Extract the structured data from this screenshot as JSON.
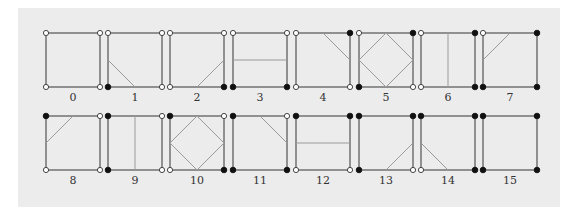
{
  "figure": {
    "colors": {
      "background": "#ececec",
      "edge": "#6a6a6a",
      "contour": "#9a9a9a",
      "vertex_filled": "#111111",
      "vertex_empty": "#ffffff"
    },
    "corner_bit_order": [
      "top-left",
      "top-right",
      "bottom-right",
      "bottom-left"
    ],
    "cases": [
      {
        "label": "0",
        "corners": [
          0,
          0,
          0,
          0
        ],
        "contour": []
      },
      {
        "label": "1",
        "corners": [
          0,
          0,
          0,
          1
        ],
        "contour": [
          [
            "L",
            "B"
          ]
        ]
      },
      {
        "label": "2",
        "corners": [
          0,
          0,
          1,
          0
        ],
        "contour": [
          [
            "B",
            "R"
          ]
        ]
      },
      {
        "label": "3",
        "corners": [
          0,
          0,
          1,
          1
        ],
        "contour": [
          [
            "L",
            "R"
          ]
        ]
      },
      {
        "label": "4",
        "corners": [
          0,
          1,
          0,
          0
        ],
        "contour": [
          [
            "T",
            "R"
          ]
        ]
      },
      {
        "label": "5",
        "corners": [
          0,
          1,
          0,
          1
        ],
        "contour": [
          [
            "L",
            "T"
          ],
          [
            "T",
            "R"
          ],
          [
            "R",
            "B"
          ],
          [
            "B",
            "L"
          ]
        ]
      },
      {
        "label": "6",
        "corners": [
          0,
          1,
          1,
          0
        ],
        "contour": [
          [
            "T",
            "B"
          ]
        ]
      },
      {
        "label": "7",
        "corners": [
          0,
          1,
          1,
          1
        ],
        "contour": [
          [
            "L",
            "T"
          ]
        ]
      },
      {
        "label": "8",
        "corners": [
          1,
          0,
          0,
          0
        ],
        "contour": [
          [
            "L",
            "T"
          ]
        ]
      },
      {
        "label": "9",
        "corners": [
          1,
          0,
          0,
          1
        ],
        "contour": [
          [
            "T",
            "B"
          ]
        ]
      },
      {
        "label": "10",
        "corners": [
          1,
          0,
          1,
          0
        ],
        "contour": [
          [
            "L",
            "T"
          ],
          [
            "T",
            "R"
          ],
          [
            "R",
            "B"
          ],
          [
            "B",
            "L"
          ]
        ]
      },
      {
        "label": "11",
        "corners": [
          1,
          0,
          1,
          1
        ],
        "contour": [
          [
            "T",
            "R"
          ]
        ]
      },
      {
        "label": "12",
        "corners": [
          1,
          1,
          0,
          0
        ],
        "contour": [
          [
            "L",
            "R"
          ]
        ]
      },
      {
        "label": "13",
        "corners": [
          1,
          1,
          0,
          1
        ],
        "contour": [
          [
            "B",
            "R"
          ]
        ]
      },
      {
        "label": "14",
        "corners": [
          1,
          1,
          1,
          0
        ],
        "contour": [
          [
            "L",
            "B"
          ]
        ]
      },
      {
        "label": "15",
        "corners": [
          1,
          1,
          1,
          1
        ],
        "contour": []
      }
    ]
  }
}
